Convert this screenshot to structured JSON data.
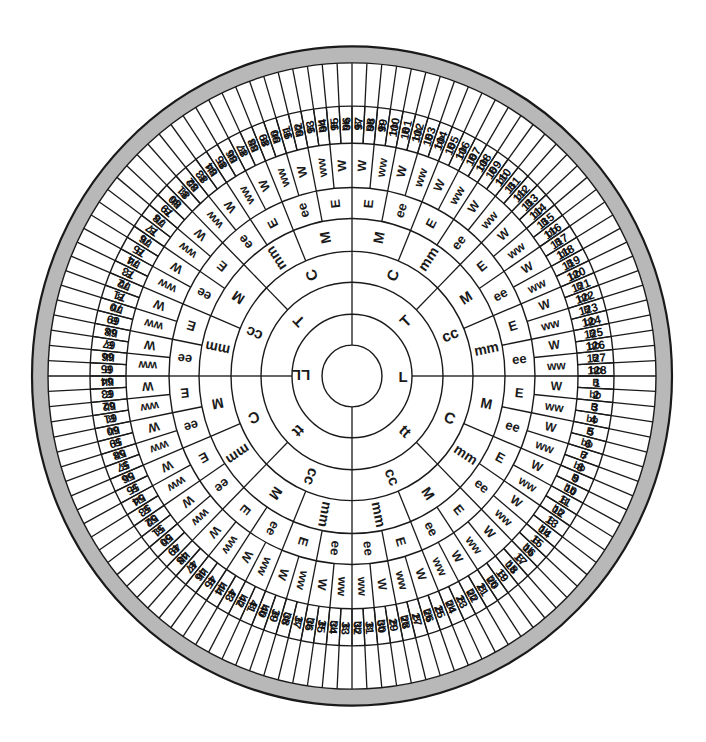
{
  "diagram": {
    "type": "concentric-ring-wheel",
    "center": {
      "x": 352,
      "y": 376
    },
    "colors": {
      "line": "#1a1a1a",
      "band": "#b8b8b8",
      "background": "#ffffff",
      "text": "#111111"
    },
    "outer_band": {
      "inner_radius": 304,
      "outer_radius": 320
    },
    "center_circle_radius": 30,
    "numbers_ring": {
      "inner_radius": 226,
      "outer_radius": 304,
      "segments": 128,
      "labels": [
        "1",
        "2",
        "3",
        "4",
        "5",
        "6",
        "7",
        "8",
        "9",
        "10",
        "11",
        "12",
        "13",
        "14",
        "15",
        "16",
        "17",
        "18",
        "19",
        "20",
        "21",
        "22",
        "23",
        "24",
        "25",
        "26",
        "27",
        "28",
        "29",
        "30",
        "31",
        "32",
        "33",
        "34",
        "35",
        "36",
        "37",
        "38",
        "39",
        "40",
        "41",
        "42",
        "43",
        "44",
        "45",
        "46",
        "47",
        "48",
        "49",
        "50",
        "51",
        "52",
        "53",
        "54",
        "55",
        "56",
        "57",
        "58",
        "59",
        "60",
        "61",
        "62",
        "63",
        "64",
        "65",
        "66",
        "67",
        "68",
        "69",
        "70",
        "71",
        "72",
        "73",
        "74",
        "75",
        "76",
        "77",
        "78",
        "79",
        "80",
        "81",
        "82",
        "83",
        "84",
        "85",
        "86",
        "87",
        "88",
        "89",
        "90",
        "91",
        "92",
        "93",
        "94",
        "95",
        "96",
        "97",
        "98",
        "99",
        "100",
        "101",
        "102",
        "103",
        "104",
        "105",
        "106",
        "107",
        "108",
        "109",
        "110",
        "111",
        "112",
        "113",
        "114",
        "115",
        "116",
        "117",
        "118",
        "119",
        "120",
        "121",
        "122",
        "123",
        "124",
        "125",
        "126",
        "127",
        "128"
      ]
    },
    "rings": [
      {
        "name": "L",
        "inner_radius": 30,
        "outer_radius": 60,
        "segments": 2,
        "start_angle": -90,
        "labels": [
          "L",
          "LL"
        ],
        "font_size": 15
      },
      {
        "name": "T",
        "inner_radius": 60,
        "outer_radius": 91,
        "segments": 4,
        "start_angle": 0,
        "labels": [
          "tt",
          "tt",
          "T",
          "T"
        ],
        "font_size": 15
      },
      {
        "name": "C",
        "inner_radius": 91,
        "outer_radius": 121,
        "segments": 8,
        "start_angle": 0,
        "labels": [
          "C",
          "cc",
          "cc",
          "C",
          "cc",
          "C",
          "C",
          "cc"
        ],
        "font_size": 15
      },
      {
        "name": "M",
        "inner_radius": 121,
        "outer_radius": 153,
        "segments": 16,
        "start_angle": 0,
        "labels": [
          "M",
          "mm",
          "M",
          "mm",
          "mm",
          "M",
          "mm",
          "M",
          "mm",
          "M",
          "mm",
          "M",
          "M",
          "mm",
          "M",
          "mm"
        ],
        "font_size": 14
      },
      {
        "name": "E",
        "inner_radius": 153,
        "outer_radius": 183,
        "segments": 32,
        "start_angle": 0,
        "labels": [
          "E",
          "ee",
          "E",
          "ee",
          "E",
          "ee",
          "E",
          "ee",
          "ee",
          "E",
          "ee",
          "E",
          "ee",
          "E",
          "ee",
          "E",
          "ee",
          "E",
          "ee",
          "E",
          "ee",
          "E",
          "ee",
          "E",
          "E",
          "ee",
          "E",
          "ee",
          "E",
          "ee",
          "E",
          "ee"
        ],
        "font_size": 13
      },
      {
        "name": "W",
        "inner_radius": 183,
        "outer_radius": 226,
        "segments": 64,
        "start_angle": 0,
        "labels": [
          "W",
          "ww",
          "W",
          "ww",
          "W",
          "ww",
          "W",
          "ww",
          "W",
          "ww",
          "W",
          "ww",
          "W",
          "ww",
          "W",
          "ww",
          "ww",
          "W",
          "ww",
          "W",
          "ww",
          "W",
          "ww",
          "W",
          "ww",
          "W",
          "ww",
          "W",
          "ww",
          "W",
          "ww",
          "W",
          "ww",
          "W",
          "ww",
          "W",
          "ww",
          "W",
          "ww",
          "W",
          "ww",
          "W",
          "ww",
          "W",
          "ww",
          "W",
          "ww",
          "W",
          "W",
          "ww",
          "W",
          "ww",
          "W",
          "ww",
          "W",
          "ww",
          "W",
          "ww",
          "W",
          "ww",
          "W",
          "ww",
          "W",
          "ww"
        ],
        "font_size": 12
      },
      {
        "name": "B",
        "inner_radius": 226,
        "outer_radius": 262,
        "segments": 128,
        "start_angle": 0,
        "labels": [
          "B",
          "bb",
          "B",
          "bb",
          "B",
          "bb",
          "B",
          "bb",
          "B",
          "bb",
          "B",
          "bb",
          "B",
          "bb",
          "B",
          "bb",
          "B",
          "bb",
          "B",
          "bb",
          "B",
          "bb",
          "B",
          "bb",
          "B",
          "bb",
          "B",
          "bb",
          "B",
          "bb",
          "B",
          "bb",
          "B",
          "bb",
          "B",
          "bb",
          "B",
          "bb",
          "B",
          "bb",
          "B",
          "bb",
          "B",
          "bb",
          "B",
          "bb",
          "B",
          "bb",
          "B",
          "bb",
          "B",
          "bb",
          "B",
          "bb",
          "B",
          "bb",
          "B",
          "bb",
          "B",
          "bb",
          "B",
          "bb",
          "B",
          "bb",
          "B",
          "bb",
          "B",
          "bb",
          "B",
          "bb",
          "B",
          "bb",
          "B",
          "bb",
          "B",
          "bb",
          "B",
          "bb",
          "B",
          "bb",
          "B",
          "bb",
          "B",
          "bb",
          "B",
          "bb",
          "B",
          "bb",
          "B",
          "bb",
          "B",
          "bb",
          "B",
          "bb",
          "B",
          "bb",
          "B",
          "bb",
          "B",
          "bb",
          "B",
          "bb",
          "B",
          "bb",
          "B",
          "bb",
          "B",
          "bb",
          "B",
          "bb",
          "B",
          "bb",
          "B",
          "bb",
          "B",
          "bb",
          "B",
          "bb",
          "B",
          "bb",
          "B",
          "bb",
          "B",
          "bb",
          "B",
          "bb",
          "B",
          "bb",
          "B",
          "bb"
        ],
        "font_size": 10
      }
    ]
  }
}
